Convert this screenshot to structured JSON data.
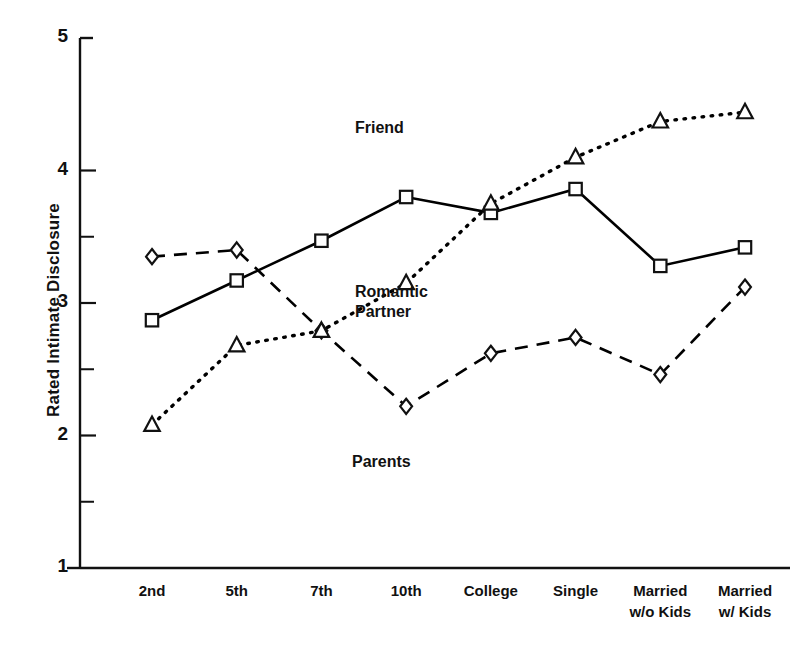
{
  "chart_data": {
    "type": "line",
    "title": "",
    "subtitle": "",
    "xlabel": "",
    "ylabel": "Rated Intimate Disclosure",
    "categories": [
      "2nd",
      "5th",
      "7th",
      "10th",
      "College",
      "Single",
      "Married\nw/o Kids",
      "Married\nw/ Kids"
    ],
    "ylim": [
      1,
      5
    ],
    "ytick_labels": [
      "5",
      "4",
      "3",
      "2",
      "1"
    ],
    "ytick_values": [
      5,
      4,
      3,
      2,
      1
    ],
    "yminor_ticks": [
      4.5,
      3.5,
      2.5,
      1.5
    ],
    "grid": false,
    "legend_position": "inline-annotations",
    "series": [
      {
        "name": "Friend",
        "marker": "square",
        "linestyle": "solid",
        "color": "#000000",
        "values": [
          2.87,
          3.17,
          3.47,
          3.8,
          3.68,
          3.86,
          3.28,
          3.42
        ]
      },
      {
        "name": "Parents",
        "marker": "diamond",
        "linestyle": "dashed",
        "color": "#000000",
        "values": [
          3.35,
          3.4,
          2.79,
          2.22,
          2.62,
          2.74,
          2.46,
          3.12
        ]
      },
      {
        "name": "Romantic\nPartner",
        "marker": "triangle",
        "linestyle": "dotted",
        "color": "#000000",
        "values": [
          2.08,
          2.68,
          2.79,
          3.15,
          3.75,
          4.1,
          4.37,
          4.44
        ]
      }
    ],
    "annotations": [
      {
        "text": "Friend",
        "series": "Friend"
      },
      {
        "text": "Romantic\nPartner",
        "series": "Romantic Partner"
      },
      {
        "text": "Parents",
        "series": "Parents"
      }
    ]
  },
  "axis": {
    "y_title": "Rated Intimate Disclosure"
  }
}
